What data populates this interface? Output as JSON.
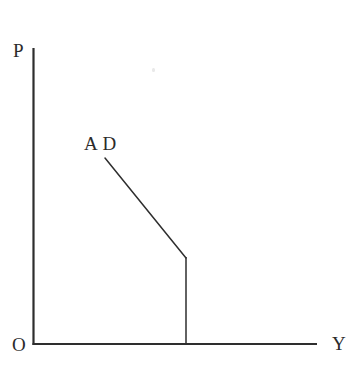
{
  "figure": {
    "width": 355,
    "height": 367,
    "background_color": "#ffffff",
    "line_color": "#2e2e2e",
    "text_color": "#2b2b2b"
  },
  "labels": {
    "y_axis_label": "P",
    "origin_label": "O",
    "x_axis_label": "Y",
    "curve_label": "A D"
  },
  "chart_data": {
    "type": "line",
    "title": "",
    "subtitle": "",
    "xlabel": "Y",
    "ylabel": "P",
    "grid": false,
    "legend": "none",
    "annotations": [
      {
        "text": "A D",
        "x_px": 85,
        "y_px": 136,
        "describes": "aggregate-demand-curve"
      },
      {
        "text": "P",
        "x_px": 14,
        "y_px": 43,
        "describes": "price-level-axis"
      },
      {
        "text": "Y",
        "x_px": 333,
        "y_px": 336,
        "describes": "output-axis"
      },
      {
        "text": "O",
        "x_px": 13,
        "y_px": 337,
        "describes": "origin"
      }
    ],
    "axes": {
      "y_axis": {
        "x_px": 33,
        "y_top_px": 48,
        "y_bottom_px": 344
      },
      "x_axis": {
        "y_px": 344,
        "x_left_px": 33,
        "x_right_px": 317
      },
      "xlim_px": [
        33,
        317
      ],
      "ylim_px": [
        344,
        48
      ],
      "ticks": [],
      "tick_labels": []
    },
    "series": [
      {
        "name": "AD",
        "label": "A D",
        "style": "solid",
        "color": "#2e2e2e",
        "description": "Kinked aggregate demand curve: downward sloping segment that becomes vertical below the kink point.",
        "points_px": [
          {
            "x": 105,
            "y": 158
          },
          {
            "x": 186,
            "y": 258
          },
          {
            "x": 186,
            "y": 344
          }
        ],
        "kink_point_px": {
          "x": 186,
          "y": 258
        }
      }
    ]
  }
}
